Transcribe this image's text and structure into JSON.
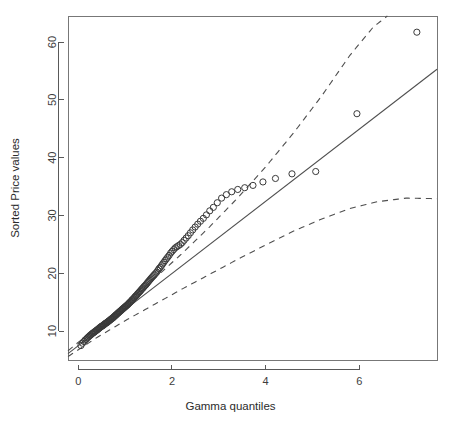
{
  "chart_data": {
    "type": "scatter",
    "title": "",
    "subtitle": "",
    "xlabel": "Gamma quantiles",
    "ylabel": "Sorted Price values",
    "xlim": [
      -0.22,
      7.66
    ],
    "ylim": [
      5.0,
      64.5
    ],
    "xticks": [
      0,
      2,
      4,
      6
    ],
    "xticklabels": [
      "0",
      "2",
      "4",
      "6"
    ],
    "yticks": [
      10,
      20,
      30,
      40,
      50,
      60
    ],
    "yticklabels": [
      "10",
      "20",
      "30",
      "40",
      "50",
      "60"
    ],
    "grid": false,
    "legend": null,
    "box": true,
    "point_marker": "open-circle",
    "point_radius": 3.1,
    "colors": {
      "point_stroke": "#3a3a3a",
      "reference_line": "#4f4f4f",
      "band_line": "#4f4f4f",
      "axis": "#595959",
      "box": "#777777",
      "text": "#2b2b2b",
      "background": "#ffffff"
    },
    "series": [
      {
        "name": "Sorted Price values vs Gamma quantiles",
        "marker": "open-circle",
        "x": [
          0.055,
          0.09,
          0.12,
          0.145,
          0.168,
          0.19,
          0.21,
          0.23,
          0.25,
          0.268,
          0.286,
          0.303,
          0.32,
          0.337,
          0.353,
          0.369,
          0.385,
          0.401,
          0.416,
          0.431,
          0.446,
          0.461,
          0.476,
          0.49,
          0.505,
          0.519,
          0.533,
          0.547,
          0.561,
          0.575,
          0.589,
          0.603,
          0.617,
          0.63,
          0.644,
          0.658,
          0.671,
          0.685,
          0.698,
          0.712,
          0.725,
          0.739,
          0.752,
          0.766,
          0.779,
          0.793,
          0.806,
          0.82,
          0.833,
          0.847,
          0.861,
          0.874,
          0.888,
          0.902,
          0.916,
          0.93,
          0.944,
          0.958,
          0.972,
          0.986,
          1.0,
          1.015,
          1.029,
          1.044,
          1.058,
          1.073,
          1.088,
          1.103,
          1.118,
          1.134,
          1.149,
          1.165,
          1.181,
          1.197,
          1.213,
          1.229,
          1.246,
          1.262,
          1.279,
          1.296,
          1.314,
          1.331,
          1.349,
          1.367,
          1.385,
          1.404,
          1.423,
          1.442,
          1.461,
          1.481,
          1.501,
          1.521,
          1.542,
          1.563,
          1.585,
          1.607,
          1.629,
          1.652,
          1.675,
          1.699,
          1.723,
          1.748,
          1.774,
          1.8,
          1.827,
          1.854,
          1.882,
          1.911,
          1.941,
          1.972,
          2.004,
          2.037,
          2.071,
          2.106,
          2.142,
          2.18,
          2.219,
          2.26,
          2.303,
          2.347,
          2.394,
          2.443,
          2.495,
          2.55,
          2.608,
          2.67,
          2.736,
          2.807,
          2.884,
          2.968,
          3.06,
          3.162,
          3.276,
          3.405,
          3.554,
          3.73,
          3.943,
          4.21,
          4.563,
          5.07,
          5.95,
          7.23
        ],
        "y": [
          7.5,
          7.9,
          8.2,
          8.45,
          8.6,
          8.8,
          8.95,
          9.1,
          9.25,
          9.35,
          9.5,
          9.6,
          9.7,
          9.8,
          9.9,
          10.0,
          10.1,
          10.2,
          10.3,
          10.4,
          10.5,
          10.6,
          10.7,
          10.8,
          10.85,
          10.95,
          11.0,
          11.1,
          11.2,
          11.3,
          11.35,
          11.45,
          11.5,
          11.6,
          11.7,
          11.8,
          11.85,
          11.95,
          12.05,
          12.15,
          12.2,
          12.3,
          12.4,
          12.5,
          12.6,
          12.7,
          12.8,
          12.9,
          13.0,
          13.1,
          13.2,
          13.3,
          13.4,
          13.5,
          13.6,
          13.7,
          13.8,
          13.9,
          14.0,
          14.1,
          14.2,
          14.3,
          14.4,
          14.5,
          14.6,
          14.75,
          14.85,
          15.0,
          15.1,
          15.25,
          15.4,
          15.5,
          15.65,
          15.8,
          15.95,
          16.1,
          16.2,
          16.4,
          16.55,
          16.7,
          16.85,
          17.0,
          17.2,
          17.35,
          17.5,
          17.7,
          17.85,
          18.0,
          18.2,
          18.4,
          18.6,
          18.8,
          19.0,
          19.2,
          19.4,
          19.6,
          19.8,
          20.0,
          20.2,
          20.5,
          20.8,
          21.0,
          21.3,
          21.6,
          21.9,
          22.2,
          22.5,
          22.8,
          23.1,
          23.5,
          23.8,
          24.1,
          24.4,
          24.6,
          24.8,
          25.0,
          25.3,
          25.7,
          26.1,
          26.5,
          27.0,
          27.5,
          28.0,
          28.5,
          29.0,
          29.5,
          30.1,
          30.8,
          31.4,
          32.2,
          33.0,
          33.6,
          34.1,
          34.5,
          34.8,
          35.2,
          35.8,
          36.4,
          37.2,
          37.6,
          47.6,
          61.7
        ]
      }
    ],
    "reference_line": {
      "name": "Theoretical gamma reference line",
      "style": "solid",
      "x": [
        -0.22,
        7.66
      ],
      "y": [
        6.1,
        55.3
      ]
    },
    "confidence_bands": [
      {
        "name": "upper-confidence-band",
        "style": "dashed",
        "x": [
          -0.22,
          0.4,
          1.0,
          1.6,
          2.2,
          2.8,
          3.4,
          4.0,
          4.6,
          5.2,
          5.8,
          6.3,
          6.6
        ],
        "y": [
          6.6,
          10.7,
          14.7,
          18.9,
          23.3,
          28.0,
          33.0,
          38.4,
          44.3,
          50.7,
          57.7,
          62.6,
          64.5
        ]
      },
      {
        "name": "lower-confidence-band",
        "style": "dashed",
        "x": [
          -0.22,
          0.4,
          1.0,
          1.6,
          2.2,
          2.8,
          3.4,
          4.0,
          4.6,
          5.2,
          5.8,
          6.4,
          7.0,
          7.66
        ],
        "y": [
          5.6,
          8.9,
          11.8,
          14.5,
          17.2,
          19.8,
          22.4,
          24.9,
          27.3,
          29.4,
          31.2,
          32.4,
          33.0,
          32.9
        ]
      }
    ]
  }
}
